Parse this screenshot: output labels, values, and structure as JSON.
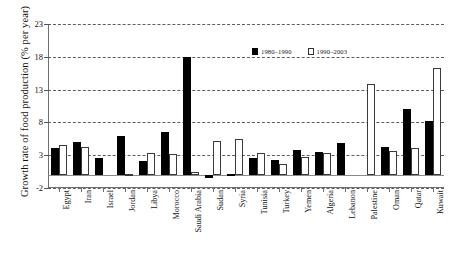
{
  "chart_data": {
    "type": "bar",
    "title": "",
    "xlabel": "",
    "ylabel": "Growth rate of food production (% per year)",
    "ylim": [
      -2,
      23
    ],
    "yticks": [
      -2,
      3,
      8,
      13,
      18,
      23
    ],
    "grid": true,
    "legend_position": "top-right",
    "categories": [
      "Egypt",
      "Iran",
      "Israel",
      "Jordan",
      "Libya",
      "Morocco",
      "Saudi Arabia",
      "Sudan",
      "Syria",
      "Tunisia",
      "Turkey",
      "Yemen",
      "Algeria",
      "Lebanon",
      "Palestine",
      "Oman",
      "Qatar",
      "Kuwait"
    ],
    "series": [
      {
        "name": "1980–1990",
        "color": "#000000",
        "values": [
          4.1,
          5.0,
          2.6,
          5.9,
          2.1,
          6.6,
          18.0,
          -0.5,
          0.2,
          2.6,
          2.3,
          3.8,
          3.5,
          4.8,
          0.0,
          4.2,
          10.0,
          8.2
        ]
      },
      {
        "name": "1990–2003",
        "color": "#ffffff",
        "values": [
          4.6,
          4.2,
          0.0,
          0.2,
          3.4,
          3.2,
          0.4,
          5.2,
          5.5,
          3.3,
          1.7,
          2.8,
          3.3,
          0.0,
          13.8,
          3.6,
          4.1,
          16.3
        ]
      }
    ]
  },
  "legend": {
    "items": [
      {
        "label": "1980–1990"
      },
      {
        "label": "1990–2003"
      }
    ]
  },
  "axes": {
    "y_title": "Growth rate of food production (% per year)",
    "y_tick_labels": [
      "-2",
      "3",
      "8",
      "13",
      "18",
      "23"
    ]
  }
}
